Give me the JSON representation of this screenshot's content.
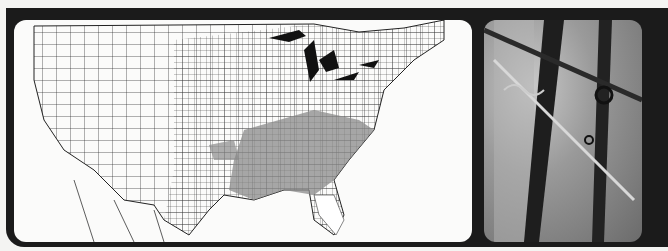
{
  "figure": {
    "map": {
      "description": "County-level map of the contiguous United States with shaded counties in the southeastern states",
      "shaded_region": "Southeast US",
      "fill_color": "#8a8a8a",
      "outline_color": "#222222"
    },
    "photo": {
      "description": "Grayscale photograph of thorny vine stems with curling tendrils"
    },
    "frame_color": "#1b1b1b",
    "background_color": "#f4f4f2"
  }
}
